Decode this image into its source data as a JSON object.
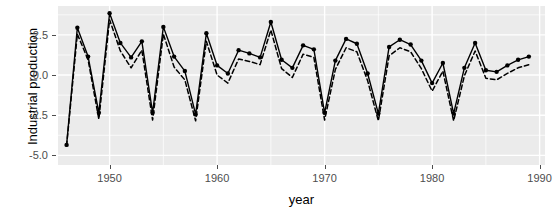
{
  "chart_data": {
    "type": "line",
    "title": "",
    "xlabel": "year",
    "ylabel": "Industrial production",
    "xlim": [
      1945.2,
      1990.5
    ],
    "ylim": [
      -5.6,
      4.3
    ],
    "grid": true,
    "legend": false,
    "x_ticks": [
      1950,
      1960,
      1970,
      1980,
      1990
    ],
    "x_tick_labels": [
      "1950",
      "1960",
      "1970",
      "1980",
      "1990"
    ],
    "y_ticks": [
      2.5,
      0.0,
      -2.5,
      -5.0
    ],
    "y_tick_labels": [
      "2.5",
      "0.0",
      "-2.5",
      "-5.0"
    ],
    "panel_background": "#ebebeb",
    "gridline_color": "#ffffff",
    "series": [
      {
        "name": "observed",
        "style": "solid",
        "color": "#000000",
        "markers": "filled-circle",
        "x": [
          1946,
          1947,
          1948,
          1949,
          1950,
          1951,
          1952,
          1953,
          1954,
          1955,
          1956,
          1957,
          1958,
          1959,
          1960,
          1961,
          1962,
          1963,
          1964,
          1965,
          1966,
          1967,
          1968,
          1969,
          1970,
          1971,
          1972,
          1973,
          1974,
          1975,
          1976,
          1977,
          1978,
          1979,
          1980,
          1981,
          1982,
          1983,
          1984,
          1985,
          1986,
          1987,
          1988,
          1989
        ],
        "y": [
          -4.35,
          2.95,
          1.15,
          -2.35,
          3.85,
          2.0,
          1.1,
          2.1,
          -2.35,
          3.0,
          1.15,
          0.25,
          -2.45,
          2.6,
          0.6,
          0.1,
          1.55,
          1.35,
          1.1,
          3.3,
          0.95,
          0.45,
          1.85,
          1.6,
          -2.35,
          0.9,
          2.25,
          1.95,
          0.1,
          -2.4,
          1.75,
          2.2,
          1.9,
          0.9,
          -0.5,
          0.75,
          -2.4,
          0.45,
          2.0,
          0.3,
          0.2,
          0.6,
          0.95,
          1.15
        ]
      },
      {
        "name": "fitted",
        "style": "dashed",
        "color": "#000000",
        "markers": "none",
        "x": [
          1946,
          1947,
          1948,
          1949,
          1950,
          1951,
          1952,
          1953,
          1954,
          1955,
          1956,
          1957,
          1958,
          1959,
          1960,
          1961,
          1962,
          1963,
          1964,
          1965,
          1966,
          1967,
          1968,
          1969,
          1970,
          1971,
          1972,
          1973,
          1974,
          1975,
          1976,
          1977,
          1978,
          1979,
          1980,
          1981,
          1982,
          1983,
          1984,
          1985,
          1986,
          1987,
          1988,
          1989
        ],
        "y": [
          -4.4,
          2.55,
          0.95,
          -2.75,
          3.45,
          1.5,
          0.45,
          1.55,
          -2.8,
          2.55,
          0.5,
          -0.3,
          -2.85,
          2.1,
          0.0,
          -0.5,
          1.0,
          0.85,
          0.65,
          2.8,
          0.4,
          -0.15,
          1.3,
          1.1,
          -2.8,
          0.35,
          1.7,
          1.45,
          -0.35,
          -2.85,
          1.2,
          1.7,
          1.45,
          0.4,
          -1.0,
          0.25,
          -2.85,
          -0.05,
          1.5,
          -0.2,
          -0.3,
          0.1,
          0.45,
          0.65
        ]
      }
    ]
  },
  "axes": {
    "y_title": "Industrial production",
    "x_title": "year"
  }
}
